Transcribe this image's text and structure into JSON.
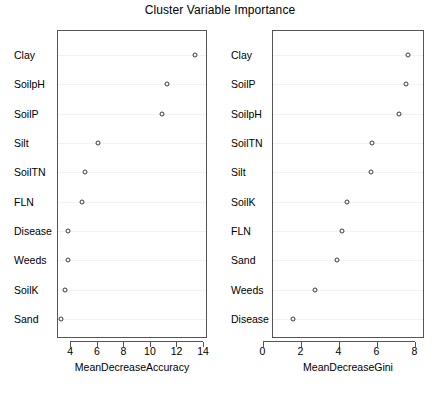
{
  "chart_data": {
    "type": "scatter",
    "title": "Cluster Variable Importance",
    "panels": [
      {
        "id": "mean-decrease-accuracy",
        "xlabel": "MeanDecreaseAccuracy",
        "xlim": [
          3.0,
          14.3
        ],
        "xticks": [
          4,
          6,
          8,
          10,
          12,
          14
        ],
        "categories": [
          "Clay",
          "SoilpH",
          "SoilP",
          "Silt",
          "SoilTN",
          "FLN",
          "Disease",
          "Weeds",
          "SoilK",
          "Sand"
        ],
        "values": [
          13.4,
          11.3,
          10.9,
          6.1,
          5.1,
          4.9,
          3.85,
          3.8,
          3.6,
          3.3
        ],
        "grid": true,
        "legend": "none"
      },
      {
        "id": "mean-decrease-gini",
        "xlabel": "MeanDecreaseGini",
        "xlim": [
          0.5,
          8.5
        ],
        "xticks": [
          0,
          2,
          4,
          6,
          8
        ],
        "categories": [
          "Clay",
          "SoilP",
          "SoilpH",
          "SoilTN",
          "Silt",
          "SoilK",
          "FLN",
          "Sand",
          "Weeds",
          "Disease"
        ],
        "values": [
          7.65,
          7.54,
          7.2,
          5.75,
          5.7,
          4.47,
          4.19,
          3.91,
          2.74,
          1.62
        ],
        "grid": true,
        "legend": "none"
      }
    ]
  },
  "colors": {
    "background": "#ffffff",
    "axis": "#555555",
    "point": "#3a3a3a",
    "gridline": "#f2f2f2",
    "text": "#000000"
  }
}
